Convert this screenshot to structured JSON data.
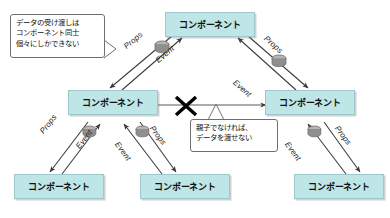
{
  "diagram": {
    "colors": {
      "box_fill": "#bfe6e6",
      "box_border": "#9ec8cc",
      "arrow": "#3a3a3a",
      "x_mark": "#000000",
      "callout_border": "#6f6f6f",
      "cylinder": "#9a9a9a",
      "background": "#ffffff"
    },
    "boxes": [
      {
        "id": "top",
        "label": "コンポーネント"
      },
      {
        "id": "mid-left",
        "label": "コンポーネント"
      },
      {
        "id": "mid-right",
        "label": "コンポーネント"
      },
      {
        "id": "bottom-left",
        "label": "コンポーネント"
      },
      {
        "id": "bottom-center",
        "label": "コンポーネント"
      },
      {
        "id": "bottom-right",
        "label": "コンポーネント"
      }
    ],
    "edge_labels": {
      "top_left_props": "Props",
      "top_left_event": "Event",
      "top_right_event": "Event",
      "top_right_props": "Props",
      "bl_props": "Props",
      "bl_event": "Event",
      "bc_event": "Event",
      "bc_props": "Props",
      "br_event": "Event",
      "br_props": "Props"
    },
    "callouts": {
      "top_left": {
        "line1": "データの受け渡しは",
        "line2": "コンポーネント同士",
        "line3": "個々にしかできない"
      },
      "center": {
        "line1": "親子でなければ、",
        "line2": "データを渡せない"
      }
    },
    "marks": {
      "blocked": "X"
    },
    "icons": {
      "cylinder": "data-cylinder-icon"
    }
  }
}
